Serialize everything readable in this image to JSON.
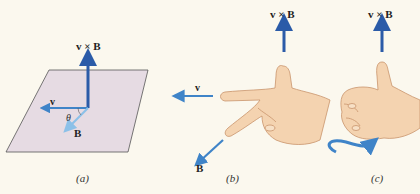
{
  "panels": [
    {
      "id": "a",
      "caption": "(a)",
      "labels": {
        "cross": "v × B",
        "v": "v",
        "B": "B",
        "theta": "θ"
      }
    },
    {
      "id": "b",
      "caption": "(b)",
      "labels": {
        "cross": "v × B",
        "v": "v",
        "B": "B"
      }
    },
    {
      "id": "c",
      "caption": "(c)",
      "labels": {
        "cross": "v × B"
      }
    }
  ],
  "colors": {
    "background": "#fbf8ee",
    "plane": "#e6dbe3",
    "arrow_dark": "#2b5ba8",
    "arrow_light": "#4a90d0",
    "arrow_B_light": "#8cc0e8",
    "skin": "#f4d3b0",
    "skin_shadow": "#e2b58e"
  }
}
